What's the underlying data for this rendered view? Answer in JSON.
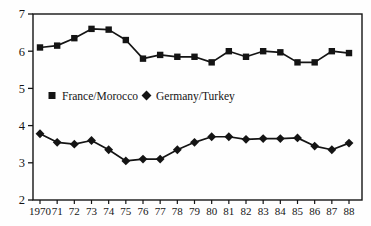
{
  "figure": {
    "background": "#fefefe",
    "ink": "#141414"
  },
  "chart_data": {
    "type": "line",
    "title": "",
    "xlabel": "",
    "ylabel": "",
    "categories": [
      "1970",
      "71",
      "72",
      "73",
      "74",
      "75",
      "76",
      "77",
      "78",
      "79",
      "80",
      "81",
      "82",
      "83",
      "84",
      "85",
      "86",
      "87",
      "88"
    ],
    "series": [
      {
        "name": "France/Morocco",
        "marker": "square",
        "values": [
          6.1,
          6.15,
          6.35,
          6.6,
          6.58,
          6.3,
          5.8,
          5.9,
          5.85,
          5.85,
          5.7,
          6.0,
          5.85,
          6.0,
          5.97,
          5.7,
          5.7,
          6.0,
          5.95
        ]
      },
      {
        "name": "Germany/Turkey",
        "marker": "diamond",
        "values": [
          3.78,
          3.55,
          3.5,
          3.6,
          3.35,
          3.05,
          3.1,
          3.1,
          3.35,
          3.55,
          3.7,
          3.7,
          3.63,
          3.65,
          3.65,
          3.67,
          3.45,
          3.35,
          3.53
        ]
      }
    ],
    "ylim": [
      2,
      7
    ],
    "yticks": [
      2,
      3,
      4,
      5,
      6,
      7
    ],
    "grid": false,
    "legend_position": "inside-middle-left",
    "line_color": "#141414"
  }
}
